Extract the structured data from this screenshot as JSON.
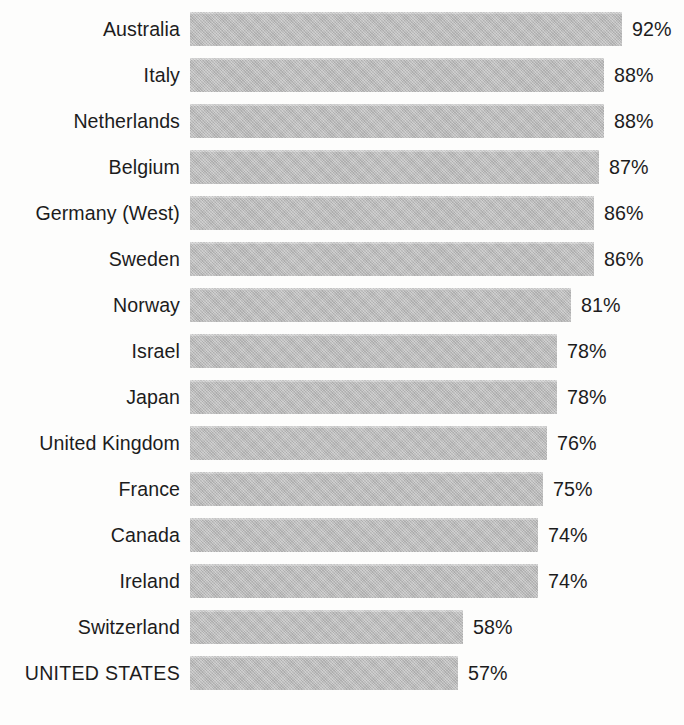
{
  "chart_data": {
    "type": "bar",
    "orientation": "horizontal",
    "title": "",
    "subtitle": "",
    "xlabel": "",
    "ylabel": "",
    "grid": false,
    "legend": null,
    "xlim": [
      0,
      92
    ],
    "value_suffix": "%",
    "sort": "descending",
    "categories": [
      "Australia",
      "Italy",
      "Netherlands",
      "Belgium",
      "Germany (West)",
      "Sweden",
      "Norway",
      "Israel",
      "Japan",
      "United Kingdom",
      "France",
      "Canada",
      "Ireland",
      "Switzerland",
      "UNITED STATES"
    ],
    "values": [
      92,
      88,
      88,
      87,
      86,
      86,
      81,
      78,
      78,
      76,
      75,
      74,
      74,
      58,
      57
    ],
    "value_labels": [
      "92%",
      "88%",
      "88%",
      "87%",
      "86%",
      "86%",
      "81%",
      "78%",
      "78%",
      "76%",
      "75%",
      "74%",
      "74%",
      "58%",
      "57%"
    ],
    "highlighted_category": "UNITED STATES"
  },
  "rows": [
    {
      "label": "Australia",
      "value": 92,
      "value_label": "92%",
      "caps": false
    },
    {
      "label": "Italy",
      "value": 88,
      "value_label": "88%",
      "caps": false
    },
    {
      "label": "Netherlands",
      "value": 88,
      "value_label": "88%",
      "caps": false
    },
    {
      "label": "Belgium",
      "value": 87,
      "value_label": "87%",
      "caps": false
    },
    {
      "label": "Germany (West)",
      "value": 86,
      "value_label": "86%",
      "caps": false
    },
    {
      "label": "Sweden",
      "value": 86,
      "value_label": "86%",
      "caps": false
    },
    {
      "label": "Norway",
      "value": 81,
      "value_label": "81%",
      "caps": false
    },
    {
      "label": "Israel",
      "value": 78,
      "value_label": "78%",
      "caps": false
    },
    {
      "label": "Japan",
      "value": 78,
      "value_label": "78%",
      "caps": false
    },
    {
      "label": "United Kingdom",
      "value": 76,
      "value_label": "76%",
      "caps": false
    },
    {
      "label": "France",
      "value": 75,
      "value_label": "75%",
      "caps": false
    },
    {
      "label": "Canada",
      "value": 74,
      "value_label": "74%",
      "caps": false
    },
    {
      "label": "Ireland",
      "value": 74,
      "value_label": "74%",
      "caps": false
    },
    {
      "label": "Switzerland",
      "value": 58,
      "value_label": "58%",
      "caps": false
    },
    {
      "label": "UNITED STATES",
      "value": 57,
      "value_label": "57%",
      "caps": true
    }
  ],
  "style": {
    "background_color": "#fdfdfc",
    "bar_color": "#b9b9b9",
    "text_color": "#1c1c1c",
    "bar_origin_x_px": 190,
    "px_per_percent": 4.7,
    "bar_height_px": 34,
    "row_pitch_px": 46,
    "label_gap_px": 10
  }
}
